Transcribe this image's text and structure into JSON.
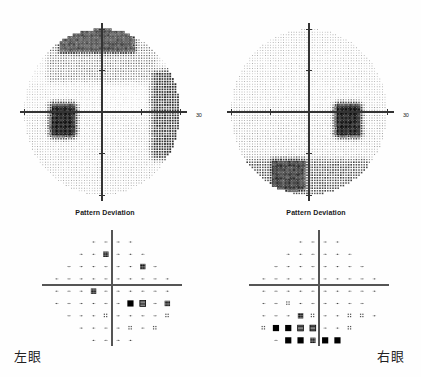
{
  "report": {
    "type": "humphrey-visual-field",
    "axis_label": "30"
  },
  "panels": [
    {
      "id": "left-eye",
      "caption": "左眼",
      "pd_title": "Pattern Deviation",
      "axis_label": "30"
    },
    {
      "id": "right-eye",
      "caption": "右眼",
      "pd_title": "Pattern Deviation",
      "axis_label": "30"
    }
  ],
  "chart_data": [
    {
      "type": "heatmap",
      "id": "grayscale-left-eye",
      "title": "",
      "xlabel": "",
      "ylabel": "",
      "legend": [],
      "notes": "Grayscale total-sensitivity map, left eye (OS). Dark = depressed sensitivity.",
      "xlim": [
        -30,
        30
      ],
      "ylim": [
        -30,
        30
      ],
      "grid": false,
      "axis_ticks": [
        -30,
        -15,
        0,
        15,
        30
      ],
      "regions": [
        {
          "name": "superior-dense-band",
          "x": [
            -16,
            12
          ],
          "y": [
            22,
            30
          ],
          "darkness": 0.85
        },
        {
          "name": "superior-mid-depression",
          "x": [
            -20,
            20
          ],
          "y": [
            12,
            24
          ],
          "darkness": 0.42
        },
        {
          "name": "temporal-arc",
          "x": [
            20,
            30
          ],
          "y": [
            -16,
            14
          ],
          "darkness": 0.72
        },
        {
          "name": "blind-spot",
          "x": [
            -19,
            -11
          ],
          "y": [
            -8,
            2
          ],
          "darkness": 1.0
        },
        {
          "name": "nasal-background",
          "x": [
            -30,
            0
          ],
          "y": [
            -30,
            10
          ],
          "darkness": 0.18
        },
        {
          "name": "inferior-background",
          "x": [
            -30,
            30
          ],
          "y": [
            -30,
            -2
          ],
          "darkness": 0.22
        }
      ]
    },
    {
      "type": "heatmap",
      "id": "grayscale-right-eye",
      "title": "",
      "xlabel": "",
      "ylabel": "",
      "legend": [],
      "notes": "Grayscale total-sensitivity map, right eye (OD). Dark = depressed sensitivity.",
      "xlim": [
        -30,
        30
      ],
      "ylim": [
        -30,
        30
      ],
      "grid": false,
      "axis_ticks": [
        -30,
        -15,
        0,
        15,
        30
      ],
      "regions": [
        {
          "name": "superior-background",
          "x": [
            -30,
            30
          ],
          "y": [
            4,
            30
          ],
          "darkness": 0.2
        },
        {
          "name": "blind-spot",
          "x": [
            11,
            19
          ],
          "y": [
            -8,
            2
          ],
          "darkness": 1.0
        },
        {
          "name": "inferior-nasal-dense",
          "x": [
            -14,
            -2
          ],
          "y": [
            -28,
            -18
          ],
          "darkness": 0.9
        },
        {
          "name": "inferior-arc",
          "x": [
            -26,
            22
          ],
          "y": [
            -30,
            -18
          ],
          "darkness": 0.6
        },
        {
          "name": "inferior-background",
          "x": [
            -30,
            30
          ],
          "y": [
            -20,
            2
          ],
          "darkness": 0.25
        }
      ]
    },
    {
      "type": "scatter",
      "id": "pattern-deviation-left-eye",
      "title": "Pattern Deviation",
      "xlabel": "",
      "ylabel": "",
      "xlim": [
        -27,
        27
      ],
      "ylim": [
        -27,
        27
      ],
      "grid": false,
      "symbol_legend": [
        {
          "code": "dot",
          "meaning": "p >= 5%"
        },
        {
          "code": "light",
          "meaning": "p < 5%"
        },
        {
          "code": "medium",
          "meaning": "p < 2%"
        },
        {
          "code": "dark",
          "meaning": "p < 1%"
        },
        {
          "code": "black",
          "meaning": "p < 0.5%"
        }
      ],
      "points": [
        {
          "x": -9,
          "y": 21,
          "sym": "dot"
        },
        {
          "x": -3,
          "y": 21,
          "sym": "dot"
        },
        {
          "x": 3,
          "y": 21,
          "sym": "dot"
        },
        {
          "x": 9,
          "y": 21,
          "sym": "dot"
        },
        {
          "x": -15,
          "y": 15,
          "sym": "dot"
        },
        {
          "x": -9,
          "y": 15,
          "sym": "dot"
        },
        {
          "x": -3,
          "y": 15,
          "sym": "dark"
        },
        {
          "x": 3,
          "y": 15,
          "sym": "dot"
        },
        {
          "x": 9,
          "y": 15,
          "sym": "dot"
        },
        {
          "x": 15,
          "y": 15,
          "sym": "dot"
        },
        {
          "x": -21,
          "y": 9,
          "sym": "dot"
        },
        {
          "x": -15,
          "y": 9,
          "sym": "dot"
        },
        {
          "x": -9,
          "y": 9,
          "sym": "dot"
        },
        {
          "x": -3,
          "y": 9,
          "sym": "dot"
        },
        {
          "x": 3,
          "y": 9,
          "sym": "dot"
        },
        {
          "x": 9,
          "y": 9,
          "sym": "dot"
        },
        {
          "x": 15,
          "y": 9,
          "sym": "dark"
        },
        {
          "x": 21,
          "y": 9,
          "sym": "dot"
        },
        {
          "x": -27,
          "y": 3,
          "sym": "dot"
        },
        {
          "x": -21,
          "y": 3,
          "sym": "dot"
        },
        {
          "x": -15,
          "y": 3,
          "sym": "dot"
        },
        {
          "x": -9,
          "y": 3,
          "sym": "dot"
        },
        {
          "x": -3,
          "y": 3,
          "sym": "dot"
        },
        {
          "x": 3,
          "y": 3,
          "sym": "dot"
        },
        {
          "x": 9,
          "y": 3,
          "sym": "dot"
        },
        {
          "x": 15,
          "y": 3,
          "sym": "dot"
        },
        {
          "x": 21,
          "y": 3,
          "sym": "dot"
        },
        {
          "x": 27,
          "y": 3,
          "sym": "dot"
        },
        {
          "x": -27,
          "y": -3,
          "sym": "dot"
        },
        {
          "x": -21,
          "y": -3,
          "sym": "dot"
        },
        {
          "x": -15,
          "y": -3,
          "sym": "dot"
        },
        {
          "x": -9,
          "y": -3,
          "sym": "dark"
        },
        {
          "x": -3,
          "y": -3,
          "sym": "dot"
        },
        {
          "x": 3,
          "y": -3,
          "sym": "dot"
        },
        {
          "x": 9,
          "y": -3,
          "sym": "dot"
        },
        {
          "x": 15,
          "y": -3,
          "sym": "dot"
        },
        {
          "x": 21,
          "y": -3,
          "sym": "dot"
        },
        {
          "x": 27,
          "y": -3,
          "sym": "dot"
        },
        {
          "x": -27,
          "y": -9,
          "sym": "dot"
        },
        {
          "x": -21,
          "y": -9,
          "sym": "dot"
        },
        {
          "x": -15,
          "y": -9,
          "sym": "dot"
        },
        {
          "x": -9,
          "y": -9,
          "sym": "dot"
        },
        {
          "x": -3,
          "y": -9,
          "sym": "dot"
        },
        {
          "x": 3,
          "y": -9,
          "sym": "dot"
        },
        {
          "x": 9,
          "y": -9,
          "sym": "black"
        },
        {
          "x": 15,
          "y": -9,
          "sym": "medium"
        },
        {
          "x": 21,
          "y": -9,
          "sym": "dot"
        },
        {
          "x": 27,
          "y": -9,
          "sym": "dark"
        },
        {
          "x": -21,
          "y": -15,
          "sym": "dot"
        },
        {
          "x": -15,
          "y": -15,
          "sym": "dot"
        },
        {
          "x": -9,
          "y": -15,
          "sym": "dot"
        },
        {
          "x": -3,
          "y": -15,
          "sym": "light"
        },
        {
          "x": 3,
          "y": -15,
          "sym": "dot"
        },
        {
          "x": 9,
          "y": -15,
          "sym": "dot"
        },
        {
          "x": 15,
          "y": -15,
          "sym": "dot"
        },
        {
          "x": 21,
          "y": -15,
          "sym": "dot"
        },
        {
          "x": 27,
          "y": -15,
          "sym": "light"
        },
        {
          "x": -15,
          "y": -21,
          "sym": "dot"
        },
        {
          "x": -9,
          "y": -21,
          "sym": "dot"
        },
        {
          "x": -3,
          "y": -21,
          "sym": "dot"
        },
        {
          "x": 3,
          "y": -21,
          "sym": "dot"
        },
        {
          "x": 9,
          "y": -21,
          "sym": "light"
        },
        {
          "x": 15,
          "y": -21,
          "sym": "dot"
        },
        {
          "x": 21,
          "y": -21,
          "sym": "light"
        },
        {
          "x": -9,
          "y": -27,
          "sym": "dot"
        },
        {
          "x": -3,
          "y": -27,
          "sym": "dot"
        },
        {
          "x": 3,
          "y": -27,
          "sym": "dot"
        },
        {
          "x": 9,
          "y": -27,
          "sym": "dot"
        }
      ]
    },
    {
      "type": "scatter",
      "id": "pattern-deviation-right-eye",
      "title": "Pattern Deviation",
      "xlabel": "",
      "ylabel": "",
      "xlim": [
        -27,
        27
      ],
      "ylim": [
        -27,
        27
      ],
      "grid": false,
      "symbol_legend": [
        {
          "code": "dot",
          "meaning": "p >= 5%"
        },
        {
          "code": "light",
          "meaning": "p < 5%"
        },
        {
          "code": "medium",
          "meaning": "p < 2%"
        },
        {
          "code": "dark",
          "meaning": "p < 1%"
        },
        {
          "code": "black",
          "meaning": "p < 0.5%"
        }
      ],
      "points": [
        {
          "x": -9,
          "y": 21,
          "sym": "dot"
        },
        {
          "x": -3,
          "y": 21,
          "sym": "dot"
        },
        {
          "x": 3,
          "y": 21,
          "sym": "dot"
        },
        {
          "x": 9,
          "y": 21,
          "sym": "dot"
        },
        {
          "x": -15,
          "y": 15,
          "sym": "dot"
        },
        {
          "x": -9,
          "y": 15,
          "sym": "dot"
        },
        {
          "x": -3,
          "y": 15,
          "sym": "dot"
        },
        {
          "x": 3,
          "y": 15,
          "sym": "dot"
        },
        {
          "x": 9,
          "y": 15,
          "sym": "dot"
        },
        {
          "x": 15,
          "y": 15,
          "sym": "dot"
        },
        {
          "x": -21,
          "y": 9,
          "sym": "dot"
        },
        {
          "x": -15,
          "y": 9,
          "sym": "dot"
        },
        {
          "x": -9,
          "y": 9,
          "sym": "dot"
        },
        {
          "x": -3,
          "y": 9,
          "sym": "dot"
        },
        {
          "x": 3,
          "y": 9,
          "sym": "dot"
        },
        {
          "x": 9,
          "y": 9,
          "sym": "dot"
        },
        {
          "x": 15,
          "y": 9,
          "sym": "dot"
        },
        {
          "x": 21,
          "y": 9,
          "sym": "dot"
        },
        {
          "x": -27,
          "y": 3,
          "sym": "dot"
        },
        {
          "x": -21,
          "y": 3,
          "sym": "dot"
        },
        {
          "x": -15,
          "y": 3,
          "sym": "dot"
        },
        {
          "x": -9,
          "y": 3,
          "sym": "dot"
        },
        {
          "x": -3,
          "y": 3,
          "sym": "dot"
        },
        {
          "x": 3,
          "y": 3,
          "sym": "dot"
        },
        {
          "x": 9,
          "y": 3,
          "sym": "dot"
        },
        {
          "x": 15,
          "y": 3,
          "sym": "dot"
        },
        {
          "x": 21,
          "y": 3,
          "sym": "dot"
        },
        {
          "x": 27,
          "y": 3,
          "sym": "dot"
        },
        {
          "x": -27,
          "y": -3,
          "sym": "dot"
        },
        {
          "x": -21,
          "y": -3,
          "sym": "dot"
        },
        {
          "x": -15,
          "y": -3,
          "sym": "dot"
        },
        {
          "x": -9,
          "y": -3,
          "sym": "dot"
        },
        {
          "x": -3,
          "y": -3,
          "sym": "dot"
        },
        {
          "x": 3,
          "y": -3,
          "sym": "dot"
        },
        {
          "x": 9,
          "y": -3,
          "sym": "dot"
        },
        {
          "x": 15,
          "y": -3,
          "sym": "dot"
        },
        {
          "x": 21,
          "y": -3,
          "sym": "dot"
        },
        {
          "x": 27,
          "y": -3,
          "sym": "dot"
        },
        {
          "x": -27,
          "y": -9,
          "sym": "dot"
        },
        {
          "x": -21,
          "y": -9,
          "sym": "dot"
        },
        {
          "x": -15,
          "y": -9,
          "sym": "light"
        },
        {
          "x": -9,
          "y": -9,
          "sym": "dot"
        },
        {
          "x": -3,
          "y": -9,
          "sym": "dot"
        },
        {
          "x": 3,
          "y": -9,
          "sym": "dot"
        },
        {
          "x": 9,
          "y": -9,
          "sym": "dot"
        },
        {
          "x": 15,
          "y": -9,
          "sym": "dot"
        },
        {
          "x": 21,
          "y": -9,
          "sym": "dot"
        },
        {
          "x": -27,
          "y": -15,
          "sym": "dot"
        },
        {
          "x": -21,
          "y": -15,
          "sym": "dot"
        },
        {
          "x": -15,
          "y": -15,
          "sym": "dot"
        },
        {
          "x": -9,
          "y": -15,
          "sym": "dark"
        },
        {
          "x": -3,
          "y": -15,
          "sym": "light"
        },
        {
          "x": 3,
          "y": -15,
          "sym": "dot"
        },
        {
          "x": 9,
          "y": -15,
          "sym": "dot"
        },
        {
          "x": 15,
          "y": -15,
          "sym": "light"
        },
        {
          "x": 21,
          "y": -15,
          "sym": "light"
        },
        {
          "x": 27,
          "y": -15,
          "sym": "dot"
        },
        {
          "x": -27,
          "y": -21,
          "sym": "light"
        },
        {
          "x": -21,
          "y": -21,
          "sym": "black"
        },
        {
          "x": -15,
          "y": -21,
          "sym": "black"
        },
        {
          "x": -9,
          "y": -21,
          "sym": "medium"
        },
        {
          "x": -3,
          "y": -21,
          "sym": "medium"
        },
        {
          "x": 3,
          "y": -21,
          "sym": "dot"
        },
        {
          "x": 9,
          "y": -21,
          "sym": "dot"
        },
        {
          "x": 15,
          "y": -21,
          "sym": "light"
        },
        {
          "x": -21,
          "y": -27,
          "sym": "dot"
        },
        {
          "x": -15,
          "y": -27,
          "sym": "black"
        },
        {
          "x": -9,
          "y": -27,
          "sym": "black"
        },
        {
          "x": -3,
          "y": -27,
          "sym": "dark"
        },
        {
          "x": 3,
          "y": -27,
          "sym": "black"
        },
        {
          "x": 9,
          "y": -27,
          "sym": "black"
        },
        {
          "x": -15,
          "y": -33,
          "sym": "dark"
        },
        {
          "x": -9,
          "y": -33,
          "sym": "black"
        },
        {
          "x": -3,
          "y": -33,
          "sym": "medium"
        },
        {
          "x": 3,
          "y": -33,
          "sym": "black"
        }
      ]
    }
  ]
}
